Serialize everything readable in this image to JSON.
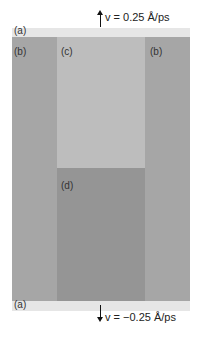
{
  "figure": {
    "top_velocity": {
      "label": "v = 0.25 Å/ps",
      "direction": "up"
    },
    "bottom_velocity": {
      "label": "v = −0.25 Å/ps",
      "direction": "down"
    },
    "regions": {
      "a_top": "(a)",
      "b_left": "(b)",
      "c": "(c)",
      "b_right": "(b)",
      "d": "(d)",
      "a_bottom": "(a)"
    },
    "colors": {
      "region_a": "#e6e6e6",
      "region_b": "#a6a6a6",
      "region_c": "#bdbdbd",
      "region_d": "#959595"
    }
  }
}
